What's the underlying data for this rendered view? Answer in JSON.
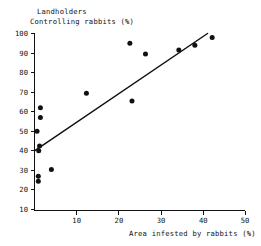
{
  "chart_data": {
    "type": "scatter",
    "title": "",
    "title_lines": [
      "Landholders",
      "Controlling rabbits (%)"
    ],
    "xlabel": "Area infested by rabbits (%)",
    "ylabel": "Landholders Controlling rabbits (%)",
    "xlim": [
      0,
      50
    ],
    "ylim": [
      0,
      100
    ],
    "xticks": [
      10,
      20,
      30,
      40,
      50
    ],
    "yticks": [
      10,
      20,
      30,
      40,
      50,
      60,
      70,
      80,
      90,
      100
    ],
    "xtick_labels": [
      "10",
      "20",
      "30",
      "40",
      "50"
    ],
    "ytick_labels": [
      "10",
      "20",
      "30",
      "40",
      "50",
      "60",
      "70",
      "80",
      "90",
      "100"
    ],
    "grid": false,
    "legend": null,
    "marker": "filled-circle",
    "marker_color": "#111111",
    "points": [
      {
        "x": 0.6,
        "y": 50.0
      },
      {
        "x": 1.4,
        "y": 62.0
      },
      {
        "x": 1.4,
        "y": 57.0
      },
      {
        "x": 1.2,
        "y": 42.5
      },
      {
        "x": 1.0,
        "y": 40.0
      },
      {
        "x": 0.9,
        "y": 27.0
      },
      {
        "x": 0.9,
        "y": 24.5
      },
      {
        "x": 4.0,
        "y": 30.5
      },
      {
        "x": 12.3,
        "y": 69.5
      },
      {
        "x": 22.6,
        "y": 95.0
      },
      {
        "x": 23.1,
        "y": 65.5
      },
      {
        "x": 26.3,
        "y": 89.5
      },
      {
        "x": 34.2,
        "y": 91.5
      },
      {
        "x": 38.0,
        "y": 94.0
      },
      {
        "x": 42.1,
        "y": 98.0
      }
    ],
    "fit_line": {
      "type": "linear-regression",
      "x_start": 0.0,
      "y_start": 40.0,
      "x_end": 41.0,
      "y_end": 100.0
    }
  }
}
